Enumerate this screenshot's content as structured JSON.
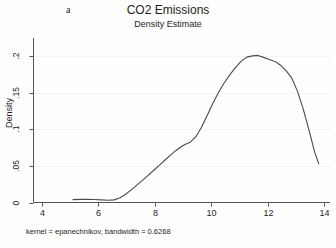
{
  "figure": {
    "panel_label": "a",
    "title": "CO2 Emissions",
    "subtitle": "Density Estimate",
    "footnote": "kernel = epanechnikov, bandwidth = 0.6268",
    "line_color": "#4a4a4a",
    "axis_color": "#555555",
    "grid_color": "#f4f4f4",
    "background": "#fefefe"
  },
  "chart_data": {
    "type": "line",
    "title": "CO2 Emissions",
    "subtitle": "Density Estimate",
    "xlabel": "",
    "ylabel": "Density",
    "xlim": [
      3.7,
      14.2
    ],
    "ylim": [
      0,
      0.225
    ],
    "xticks": [
      4,
      6,
      8,
      10,
      12,
      14
    ],
    "xtick_labels": [
      "4",
      "6",
      "8",
      "10",
      "12",
      "14"
    ],
    "yticks": [
      0,
      0.05,
      0.1,
      0.15,
      0.2
    ],
    "ytick_labels": [
      "0",
      ".05",
      ".1",
      ".15",
      ".2"
    ],
    "grid": true,
    "legend": null,
    "annotation": "kernel = epanechnikov, bandwidth = 0.6268",
    "series": [
      {
        "name": "Density Estimate",
        "x": [
          5.1,
          5.35,
          5.6,
          5.85,
          6.1,
          6.35,
          6.55,
          6.75,
          6.95,
          7.15,
          7.35,
          7.55,
          7.75,
          7.95,
          8.15,
          8.35,
          8.55,
          8.75,
          8.95,
          9.1,
          9.25,
          9.45,
          9.65,
          9.85,
          10.05,
          10.25,
          10.45,
          10.65,
          10.85,
          11.05,
          11.25,
          11.45,
          11.65,
          11.85,
          12.05,
          12.25,
          12.45,
          12.65,
          12.85,
          13.05,
          13.25,
          13.45,
          13.65,
          13.8
        ],
        "y": [
          0.004,
          0.0043,
          0.0044,
          0.0042,
          0.0036,
          0.003,
          0.0036,
          0.0062,
          0.011,
          0.017,
          0.0235,
          0.03,
          0.0368,
          0.0438,
          0.0508,
          0.0578,
          0.0648,
          0.0712,
          0.077,
          0.08,
          0.0825,
          0.09,
          0.103,
          0.119,
          0.1355,
          0.1505,
          0.1635,
          0.1745,
          0.1845,
          0.193,
          0.1988,
          0.2005,
          0.2012,
          0.1985,
          0.1955,
          0.193,
          0.1878,
          0.18,
          0.17,
          0.152,
          0.128,
          0.1,
          0.07,
          0.053
        ]
      }
    ]
  }
}
